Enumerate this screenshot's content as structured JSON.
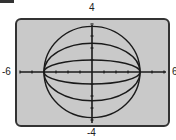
{
  "chart_data": {
    "type": "line",
    "title": "",
    "xlabel": "",
    "ylabel": "",
    "xlim": [
      -6,
      6
    ],
    "ylim": [
      -4,
      4
    ],
    "grid": false,
    "axis_tick_spacing": 1,
    "window_labels": {
      "xmin": "-6",
      "xmax": "6",
      "ymin": "-4",
      "ymax": "4"
    },
    "series": [
      {
        "name": "ellipse 1",
        "equation": "x^2/16 + y^2/b^2 = 1",
        "a": 4,
        "b": 3.8
      },
      {
        "name": "ellipse 2",
        "equation": "x^2/16 + y^2/b^2 = 1",
        "a": 4,
        "b": 2.4
      },
      {
        "name": "ellipse 3",
        "equation": "x^2/16 + y^2/b^2 = 1",
        "a": 4,
        "b": 1
      }
    ],
    "colors": {
      "screen": "#c9c9c9",
      "curve": "#1a1a1a",
      "axis": "#1a1a1a",
      "border": "#333333"
    }
  }
}
